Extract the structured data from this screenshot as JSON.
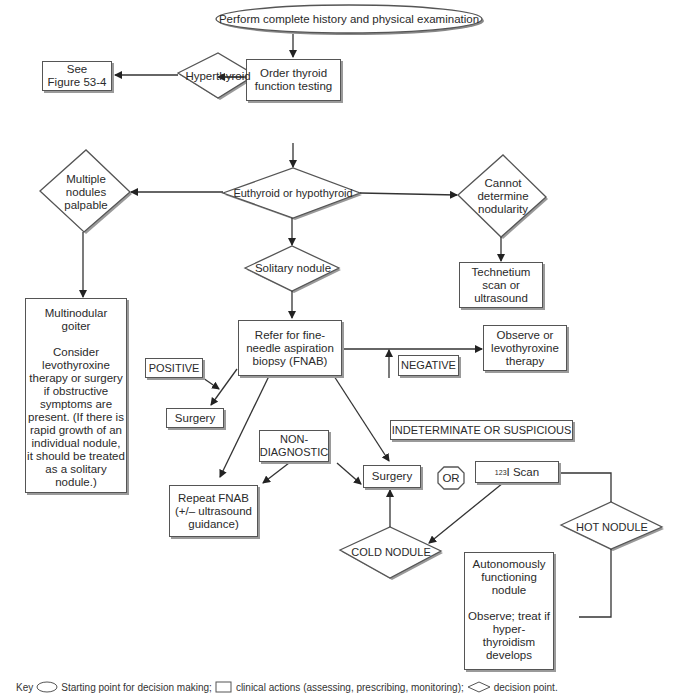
{
  "diagram": {
    "start": {
      "label": "Perform complete history and physical examination"
    },
    "order_tft": {
      "label": "Order thyroid\nfunction testing"
    },
    "hyperthyroid": {
      "label": "Hyperthyroid"
    },
    "see_figure": {
      "label": "See\nFigure 53-4"
    },
    "euthyroid": {
      "label": "Euthyroid or hypothyroid"
    },
    "multiple_nodules": {
      "label": "Multiple\nnodules\npalpable"
    },
    "cannot_determine": {
      "label": "Cannot\ndetermine\nnodularity"
    },
    "technetium": {
      "label": "Technetium\nscan or\nultrasound"
    },
    "solitary": {
      "label": "Solitary nodule"
    },
    "multinodular": {
      "label": "Multinodular\ngoiter\n\nConsider\nlevothyroxine\ntherapy or surgery\nif obstructive\nsymptoms are\npresent. (If there is\nrapid growth of an\nindividual nodule,\nit should be treated\nas a solitary\nnodule.)"
    },
    "fnab": {
      "label": "Refer for fine-\nneedle aspiration\nbiopsy (FNAB)"
    },
    "positive": {
      "label": "POSITIVE"
    },
    "surgery1": {
      "label": "Surgery"
    },
    "negative": {
      "label": "NEGATIVE"
    },
    "observe": {
      "label": "Observe or\nlevothyroxine\ntherapy"
    },
    "indeterminate": {
      "label": "INDETERMINATE OR SUSPICIOUS"
    },
    "nondiagnostic": {
      "label": "NON-\nDIAGNOSTIC"
    },
    "repeat_fnab": {
      "label": "Repeat FNAB\n(+/– ultrasound\nguidance)"
    },
    "surgery2": {
      "label": "Surgery"
    },
    "or": {
      "label": "OR"
    },
    "i_scan": {
      "sup": "123",
      "label": "I Scan"
    },
    "cold_nodule": {
      "label": "COLD NODULE"
    },
    "hot_nodule": {
      "label": "HOT NODULE"
    },
    "autonomous": {
      "label": "Autonomously\nfunctioning\nnodule\n\nObserve; treat if\nhyper-\nthyroidism\ndevelops"
    }
  },
  "key": {
    "title": "Key",
    "oval_desc": "Starting point for decision making;",
    "rect_desc": "clinical actions (assessing, prescribing, monitoring);",
    "diamond_desc": "decision point."
  },
  "colors": {
    "line": "#333333",
    "shadow": "#9a9a9a",
    "border": "#555555"
  }
}
